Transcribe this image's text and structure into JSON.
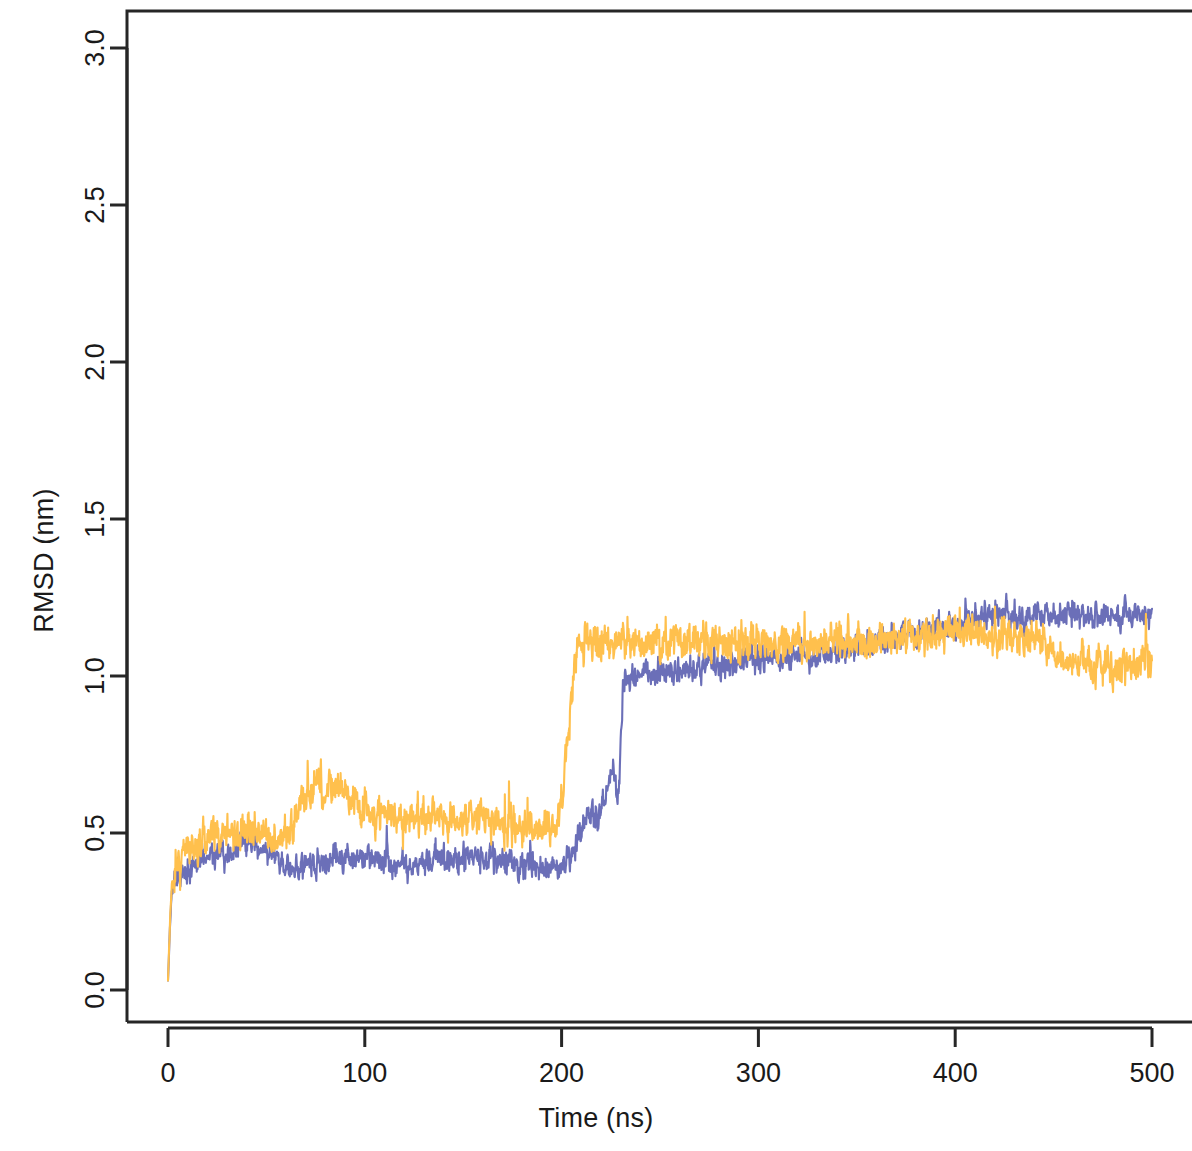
{
  "chart_data": {
    "type": "line",
    "title": "",
    "subtitle": "",
    "xlabel": "Time (ns)",
    "ylabel": "RMSD (nm)",
    "xlim": [
      0,
      500
    ],
    "ylim": [
      0.0,
      3.1
    ],
    "xticks": [
      0,
      100,
      200,
      300,
      400,
      500
    ],
    "xtick_labels": [
      "0",
      "100",
      "200",
      "300",
      "400",
      "500"
    ],
    "yticks": [
      0.0,
      0.5,
      1.0,
      1.5,
      2.0,
      2.5,
      3.0
    ],
    "ytick_labels": [
      "0.0",
      "0.5",
      "1.0",
      "1.5",
      "2.0",
      "2.5",
      "3.0"
    ],
    "grid": false,
    "legend": "none",
    "box": true,
    "colors": {
      "series_1": "#6B6FB8",
      "series_2": "#FFC04D",
      "axis": "#262626",
      "background": "#ffffff"
    },
    "series": [
      {
        "name": "series_1",
        "color": "#6B6FB8",
        "noise": 0.055,
        "seed": 20411,
        "x": [
          0,
          1,
          2,
          4,
          7,
          12,
          20,
          30,
          42,
          50,
          58,
          65,
          72,
          80,
          90,
          100,
          112,
          125,
          138,
          150,
          162,
          175,
          188,
          196,
          200,
          205,
          210,
          214,
          218,
          222,
          226,
          229,
          231,
          233,
          237,
          243,
          250,
          260,
          272,
          285,
          300,
          315,
          330,
          345,
          360,
          372,
          385,
          400,
          412,
          424,
          432,
          440,
          452,
          465,
          478,
          490,
          500
        ],
        "y": [
          0.03,
          0.2,
          0.3,
          0.35,
          0.37,
          0.4,
          0.43,
          0.44,
          0.47,
          0.45,
          0.39,
          0.38,
          0.4,
          0.41,
          0.42,
          0.42,
          0.41,
          0.4,
          0.41,
          0.41,
          0.42,
          0.4,
          0.39,
          0.39,
          0.4,
          0.42,
          0.5,
          0.58,
          0.52,
          0.62,
          0.7,
          0.62,
          0.95,
          1.0,
          1.0,
          1.0,
          1.01,
          1.02,
          1.03,
          1.04,
          1.05,
          1.06,
          1.07,
          1.08,
          1.1,
          1.13,
          1.15,
          1.16,
          1.18,
          1.21,
          1.18,
          1.19,
          1.19,
          1.19,
          1.19,
          1.19,
          1.19
        ]
      },
      {
        "name": "series_2",
        "color": "#FFC04D",
        "noise": 0.075,
        "seed": 77123,
        "x": [
          0,
          1,
          2,
          4,
          7,
          12,
          20,
          30,
          40,
          50,
          58,
          64,
          70,
          76,
          82,
          88,
          94,
          100,
          108,
          116,
          124,
          132,
          140,
          150,
          160,
          170,
          180,
          190,
          196,
          200,
          203,
          206,
          209,
          213,
          220,
          230,
          240,
          255,
          270,
          285,
          300,
          315,
          330,
          345,
          360,
          375,
          390,
          405,
          420,
          435,
          445,
          452,
          460,
          470,
          480,
          490,
          500
        ],
        "y": [
          0.03,
          0.22,
          0.32,
          0.4,
          0.44,
          0.46,
          0.49,
          0.5,
          0.52,
          0.49,
          0.48,
          0.53,
          0.62,
          0.65,
          0.62,
          0.66,
          0.6,
          0.58,
          0.58,
          0.56,
          0.54,
          0.57,
          0.55,
          0.54,
          0.55,
          0.53,
          0.51,
          0.5,
          0.52,
          0.58,
          0.8,
          1.02,
          1.1,
          1.11,
          1.11,
          1.11,
          1.11,
          1.12,
          1.11,
          1.1,
          1.11,
          1.11,
          1.1,
          1.11,
          1.12,
          1.13,
          1.14,
          1.14,
          1.13,
          1.12,
          1.11,
          1.05,
          1.04,
          1.05,
          1.02,
          1.04,
          1.05
        ]
      }
    ]
  },
  "axes": {
    "y_label": "RMSD (nm)",
    "x_label": "Time (ns)"
  },
  "geometry": {
    "box_left": 127,
    "box_right": 1192,
    "box_top": 11,
    "box_bottom": 1022,
    "x_zero_px": 168,
    "x_span_px": 984,
    "x_span_units": 500,
    "y_zero_px": 990,
    "y_unit_px": 314
  }
}
